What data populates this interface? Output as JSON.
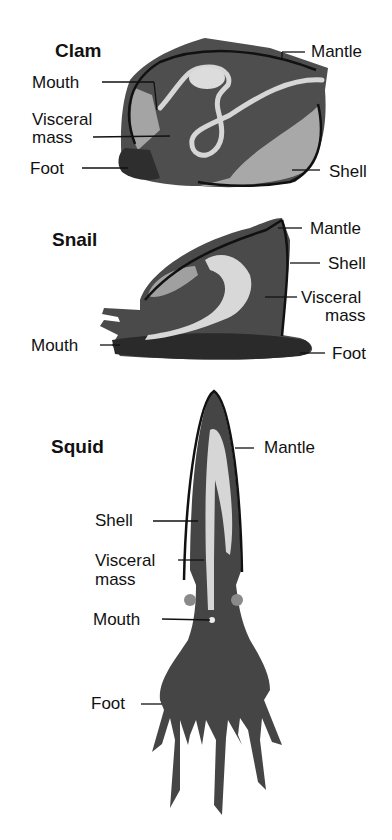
{
  "diagram": {
    "topic": "Mollusk body plans",
    "organisms": [
      {
        "name": "Clam",
        "labels": [
          "Mantle",
          "Mouth",
          "Visceral mass",
          "Foot",
          "Shell"
        ]
      },
      {
        "name": "Snail",
        "labels": [
          "Mantle",
          "Shell",
          "Visceral mass",
          "Mouth",
          "Foot"
        ]
      },
      {
        "name": "Squid",
        "labels": [
          "Mantle",
          "Shell",
          "Visceral mass",
          "Mouth",
          "Foot"
        ]
      }
    ]
  },
  "colors": {
    "body_dark": "#4a4a4a",
    "body_mid": "#6a6a6a",
    "body_light": "#a8a8a8",
    "gut": "#d8d8d8",
    "outline": "#111111"
  },
  "clam": {
    "title": "Clam",
    "mantle": "Mantle",
    "mouth": "Mouth",
    "visceral1": "Visceral",
    "visceral2": "mass",
    "foot": "Foot",
    "shell": "Shell"
  },
  "snail": {
    "title": "Snail",
    "mantle": "Mantle",
    "shell": "Shell",
    "visceral1": "Visceral",
    "visceral2": "mass",
    "mouth": "Mouth",
    "foot": "Foot"
  },
  "squid": {
    "title": "Squid",
    "mantle": "Mantle",
    "shell": "Shell",
    "visceral1": "Visceral",
    "visceral2": "mass",
    "mouth": "Mouth",
    "foot": "Foot"
  }
}
